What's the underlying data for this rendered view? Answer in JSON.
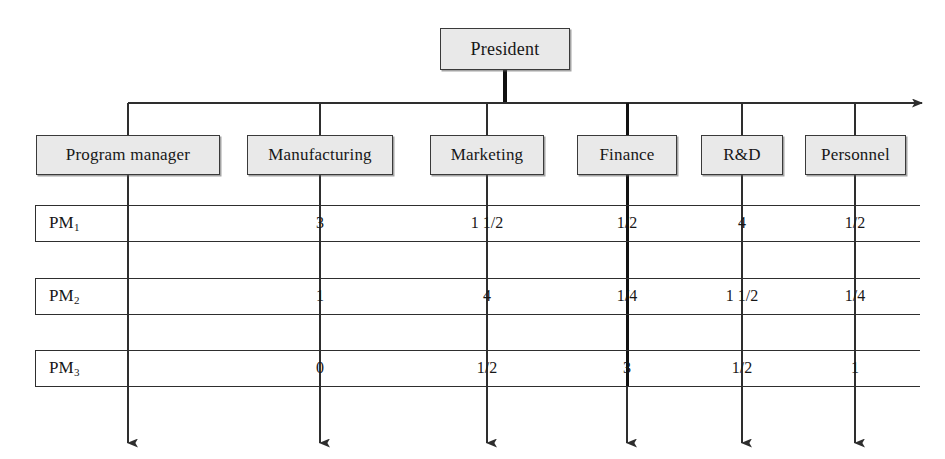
{
  "diagram": {
    "root": {
      "label": "President"
    },
    "departments": [
      {
        "label": "Program manager",
        "cx": 128,
        "box_left": 36,
        "box_width": 184,
        "emphasis": false
      },
      {
        "label": "Manufacturing",
        "cx": 320,
        "box_left": 247,
        "box_width": 146,
        "emphasis": false
      },
      {
        "label": "Marketing",
        "cx": 487,
        "box_left": 430,
        "box_width": 114,
        "emphasis": false
      },
      {
        "label": "Finance",
        "cx": 627,
        "box_left": 577,
        "box_width": 100,
        "emphasis": true
      },
      {
        "label": "R&D",
        "cx": 742,
        "box_left": 701,
        "box_width": 82,
        "emphasis": false
      },
      {
        "label": "Personnel",
        "cx": 855,
        "box_left": 805,
        "box_width": 101,
        "emphasis": false
      }
    ],
    "rows": [
      {
        "label": "PM",
        "sub": "1",
        "values": [
          "",
          "3",
          "1 1/2",
          "1/2",
          "4",
          "1/2"
        ]
      },
      {
        "label": "PM",
        "sub": "2",
        "values": [
          "",
          "1",
          "4",
          "1/4",
          "1 1/2",
          "1/4"
        ]
      },
      {
        "label": "PM",
        "sub": "3",
        "values": [
          "",
          "0",
          "1/2",
          "3",
          "1/2",
          "1"
        ]
      }
    ],
    "colors": {
      "box_fill": "#e9e9e9",
      "box_border": "#3a3a3a",
      "line": "#2e2e2e",
      "emphasis_line": "#111111",
      "background": "#ffffff"
    },
    "geometry": {
      "bus_y": 103,
      "bus_left": 128,
      "bus_right": 922,
      "president_box": {
        "left": 440,
        "top": 28,
        "width": 130,
        "height": 42
      },
      "dept_box_top": 135,
      "dept_box_height": 40,
      "row_left": 35,
      "row_right": 920,
      "row_tops": [
        205,
        278,
        350
      ],
      "row_height": 37,
      "arrow_bottom_y": 443
    }
  }
}
